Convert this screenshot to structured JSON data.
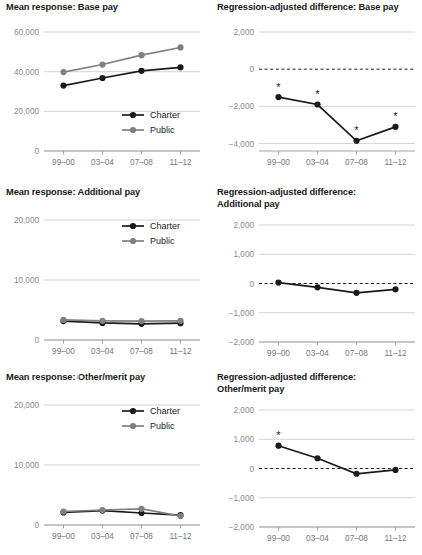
{
  "figure": {
    "width": 422,
    "height": 555,
    "background": "#ffffff",
    "stray_mark": "·"
  },
  "colors": {
    "charter": "#1a1a1a",
    "public": "#808080",
    "grid": "#c9c9c9",
    "axis": "#9a9a9a",
    "tick_text": "#8a8a8a",
    "title_text": "#1a1a1a",
    "zero_dash": "#1a1a1a"
  },
  "categories": [
    "99–00",
    "03–04",
    "07–08",
    "11–12"
  ],
  "legend": {
    "charter_label": "Charter",
    "public_label": "Public"
  },
  "chart_data": [
    {
      "id": "mean-base-pay",
      "type": "line",
      "title": "Mean response: Base pay",
      "xlabel": "",
      "ylabel": "",
      "categories": [
        "99–00",
        "03–04",
        "07–08",
        "11–12"
      ],
      "yticks": [
        0,
        20000,
        40000,
        60000
      ],
      "yticklabels": [
        "0",
        "20,000",
        "40,000",
        "60,000"
      ],
      "ylim": [
        0,
        60000
      ],
      "grid": true,
      "legend_position": "inside-lower-right",
      "series": [
        {
          "name": "Charter",
          "color": "#1a1a1a",
          "values": [
            33000,
            36800,
            40400,
            42200
          ]
        },
        {
          "name": "Public",
          "color": "#808080",
          "values": [
            39800,
            43600,
            48300,
            52200
          ]
        }
      ]
    },
    {
      "id": "regadj-base-pay",
      "type": "line",
      "title": "Regression-adjusted difference: Base pay",
      "xlabel": "",
      "ylabel": "",
      "categories": [
        "99–00",
        "03–04",
        "07–08",
        "11–12"
      ],
      "yticks": [
        -4000,
        -2000,
        0,
        2000
      ],
      "yticklabels": [
        "−4,000",
        "−2,000",
        "0",
        "2,000"
      ],
      "ylim": [
        -4400,
        2000
      ],
      "grid": true,
      "zero_line": true,
      "legend_position": "none",
      "series": [
        {
          "name": "Difference",
          "color": "#1a1a1a",
          "values": [
            -1500,
            -1900,
            -3850,
            -3100
          ],
          "significance": [
            "*",
            "*",
            "*",
            "*"
          ]
        }
      ]
    },
    {
      "id": "mean-additional-pay",
      "type": "line",
      "title": "Mean response: Additional pay",
      "xlabel": "",
      "ylabel": "",
      "categories": [
        "99–00",
        "03–04",
        "07–08",
        "11–12"
      ],
      "yticks": [
        0,
        10000,
        20000
      ],
      "yticklabels": [
        "0",
        "10,000",
        "20,000"
      ],
      "ylim": [
        0,
        20000
      ],
      "grid": true,
      "legend_position": "inside-upper-right",
      "series": [
        {
          "name": "Charter",
          "color": "#1a1a1a",
          "values": [
            3150,
            2850,
            2700,
            2800
          ]
        },
        {
          "name": "Public",
          "color": "#808080",
          "values": [
            3350,
            3200,
            3150,
            3200
          ]
        }
      ]
    },
    {
      "id": "regadj-additional-pay",
      "type": "line",
      "title": "Regression-adjusted difference:\nAdditional pay",
      "xlabel": "",
      "ylabel": "",
      "categories": [
        "99–00",
        "03–04",
        "07–08",
        "11–12"
      ],
      "yticks": [
        -2000,
        -1000,
        0,
        1000,
        2000
      ],
      "yticklabels": [
        "−2,000",
        "−1,000",
        "0",
        "1,000",
        "2,000"
      ],
      "ylim": [
        -2000,
        2000
      ],
      "grid": true,
      "zero_line": true,
      "legend_position": "none",
      "series": [
        {
          "name": "Difference",
          "color": "#1a1a1a",
          "values": [
            30,
            -130,
            -320,
            -200
          ],
          "significance": [
            "",
            "",
            "",
            ""
          ]
        }
      ]
    },
    {
      "id": "mean-other-merit-pay",
      "type": "line",
      "title": "Mean response: Other/merit pay",
      "xlabel": "",
      "ylabel": "",
      "categories": [
        "99–00",
        "03–04",
        "07–08",
        "11–12"
      ],
      "yticks": [
        0,
        10000,
        20000
      ],
      "yticklabels": [
        "0",
        "10,000",
        "20,000"
      ],
      "ylim": [
        0,
        20000
      ],
      "grid": true,
      "legend_position": "inside-upper-right",
      "series": [
        {
          "name": "Charter",
          "color": "#1a1a1a",
          "values": [
            2100,
            2400,
            2000,
            1650
          ]
        },
        {
          "name": "Public",
          "color": "#808080",
          "values": [
            2250,
            2500,
            2700,
            1500
          ]
        }
      ]
    },
    {
      "id": "regadj-other-merit-pay",
      "type": "line",
      "title": "Regression-adjusted difference:\nOther/merit pay",
      "xlabel": "",
      "ylabel": "",
      "categories": [
        "99–00",
        "03–04",
        "07–08",
        "11–12"
      ],
      "yticks": [
        -2000,
        -1000,
        0,
        1000,
        2000
      ],
      "yticklabels": [
        "−2,000",
        "−1,000",
        "0",
        "1,000",
        "2,000"
      ],
      "ylim": [
        -2000,
        2000
      ],
      "grid": true,
      "zero_line": true,
      "legend_position": "none",
      "series": [
        {
          "name": "Difference",
          "color": "#1a1a1a",
          "values": [
            780,
            350,
            -180,
            -50
          ],
          "significance": [
            "*",
            "",
            "",
            ""
          ]
        }
      ]
    }
  ]
}
